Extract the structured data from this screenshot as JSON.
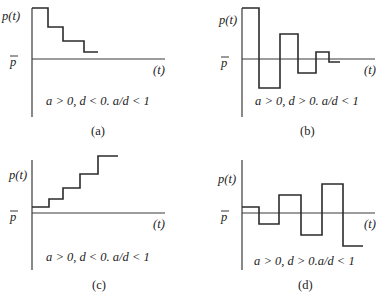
{
  "panels": [
    {
      "id": "a",
      "caption": "(a)",
      "y_label": "p(t)",
      "equilibrium_label": "p",
      "x_label": "(t)",
      "condition": "a > 0, d < 0. a/d < 1",
      "behavior": "monotonic convergence from above",
      "origin": [
        32,
        59
      ],
      "y_axis": [
        8,
        117
      ],
      "x_axis_end": 165,
      "steps": [
        [
          32,
          48,
          8
        ],
        [
          48,
          63,
          27
        ],
        [
          63,
          84,
          41
        ],
        [
          84,
          98,
          52
        ]
      ]
    },
    {
      "id": "b",
      "caption": "(b)",
      "y_label": "p(t)",
      "equilibrium_label": "p",
      "x_label": "(t)",
      "condition": "a > 0, d > 0. a/d < 1",
      "behavior": "damped oscillation converging",
      "origin": [
        242,
        59
      ],
      "y_axis": [
        8,
        117
      ],
      "x_axis_end": 375,
      "steps": [
        [
          242,
          259,
          8
        ],
        [
          259,
          280,
          88
        ],
        [
          280,
          298,
          34
        ],
        [
          298,
          316,
          73
        ],
        [
          316,
          329,
          52
        ],
        [
          329,
          340,
          62
        ]
      ]
    },
    {
      "id": "c",
      "caption": "(c)",
      "y_label": "p(t)",
      "equilibrium_label": "p",
      "x_label": "(t)",
      "condition": "a > 0, d < 0. a/d < 1",
      "behavior": "monotonic divergence upward",
      "origin": [
        32,
        213
      ],
      "y_axis": [
        160,
        270
      ],
      "x_axis_end": 165,
      "steps": [
        [
          32,
          49,
          207
        ],
        [
          49,
          63,
          199
        ],
        [
          63,
          80,
          188
        ],
        [
          80,
          98,
          174
        ],
        [
          98,
          118,
          156
        ]
      ]
    },
    {
      "id": "d",
      "caption": "(d)",
      "y_label": "p(t)",
      "equilibrium_label": "p",
      "x_label": "(t)",
      "condition": "a > 0, d > 0.a/d < 1",
      "behavior": "explosive oscillation",
      "origin": [
        242,
        213
      ],
      "y_axis": [
        160,
        270
      ],
      "x_axis_end": 375,
      "steps": [
        [
          242,
          259,
          207
        ],
        [
          259,
          279,
          224
        ],
        [
          279,
          301,
          195
        ],
        [
          301,
          322,
          235
        ],
        [
          322,
          343,
          184
        ],
        [
          343,
          363,
          246
        ]
      ]
    }
  ]
}
